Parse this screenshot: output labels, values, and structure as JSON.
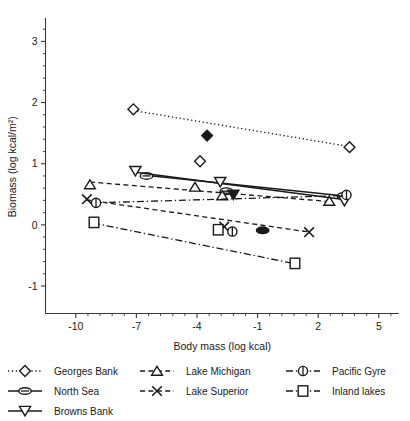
{
  "chart_data": {
    "type": "scatter",
    "title": "",
    "xlabel": "Body mass (log kcal)",
    "ylabel": "Biomass (log kcal/m²)",
    "xlim": [
      -11.5,
      6.0
    ],
    "ylim": [
      -1.45,
      3.35
    ],
    "xticks": [
      -10,
      -7,
      -4,
      -1,
      2,
      5
    ],
    "xticklabels": [
      "-10",
      "-7",
      "-4",
      "-1",
      "2",
      "5"
    ],
    "yticks": [
      -1,
      0,
      1,
      2,
      3
    ],
    "yticklabels": [
      "-1",
      "0",
      "1",
      "2",
      "3"
    ],
    "xminor_step": 0.6,
    "yminor_step": 0.2,
    "grid": false,
    "legend_position": "below-axes",
    "series": [
      {
        "name": "Georges Bank",
        "marker": "diamond",
        "linestyle": "dotted",
        "fill": "none",
        "points": [
          {
            "x": -7.15,
            "y": 1.89
          },
          {
            "x": -3.5,
            "y": 1.46,
            "fill": "solid"
          },
          {
            "x": -3.85,
            "y": 1.04
          },
          {
            "x": 3.55,
            "y": 1.27
          }
        ],
        "fit": {
          "x0": -7.15,
          "y0": 1.87,
          "x1": 3.55,
          "y1": 1.28
        }
      },
      {
        "name": "North Sea",
        "marker": "ellipse",
        "linestyle": "solid",
        "fill": "none",
        "points": [
          {
            "x": -6.5,
            "y": 0.8
          },
          {
            "x": -2.55,
            "y": 0.55
          },
          {
            "x": -0.75,
            "y": -0.09,
            "fill": "solid"
          },
          {
            "x": 3.25,
            "y": 0.47
          }
        ],
        "fit": {
          "x0": -6.55,
          "y0": 0.81,
          "x1": 3.3,
          "y1": 0.47
        }
      },
      {
        "name": "Browns Bank",
        "marker": "triangle-down",
        "linestyle": "solid",
        "fill": "none",
        "points": [
          {
            "x": -7.05,
            "y": 0.88
          },
          {
            "x": -2.85,
            "y": 0.7
          },
          {
            "x": -2.2,
            "y": 0.49,
            "fill": "solid"
          },
          {
            "x": 3.3,
            "y": 0.39
          }
        ],
        "fit": {
          "x0": -7.05,
          "y0": 0.86,
          "x1": 3.35,
          "y1": 0.41
        }
      },
      {
        "name": "Lake Michigan",
        "marker": "triangle-up",
        "linestyle": "dashed",
        "fill": "none",
        "points": [
          {
            "x": -9.3,
            "y": 0.66
          },
          {
            "x": -4.1,
            "y": 0.62
          },
          {
            "x": -2.75,
            "y": 0.48
          },
          {
            "x": 2.55,
            "y": 0.39
          }
        ],
        "fit": {
          "x0": -9.3,
          "y0": 0.7,
          "x1": 2.6,
          "y1": 0.38
        }
      },
      {
        "name": "Lake Superior",
        "marker": "x",
        "linestyle": "dashed",
        "fill": "none",
        "points": [
          {
            "x": -9.45,
            "y": 0.42
          },
          {
            "x": -2.65,
            "y": -0.03
          },
          {
            "x": 1.55,
            "y": -0.12
          }
        ],
        "fit": {
          "x0": -9.5,
          "y0": 0.41,
          "x1": 1.6,
          "y1": -0.12
        }
      },
      {
        "name": "Pacific Gyre",
        "marker": "circle-bar",
        "linestyle": "dashdot",
        "fill": "none",
        "points": [
          {
            "x": -9.0,
            "y": 0.36
          },
          {
            "x": -2.25,
            "y": -0.11
          },
          {
            "x": 3.4,
            "y": 0.49
          }
        ],
        "fit": {
          "x0": -9.05,
          "y0": 0.36,
          "x1": 3.4,
          "y1": 0.48
        }
      },
      {
        "name": "Inland lakes",
        "marker": "square",
        "linestyle": "dashdot",
        "fill": "none",
        "points": [
          {
            "x": -9.1,
            "y": 0.04
          },
          {
            "x": -2.95,
            "y": -0.08
          },
          {
            "x": 0.85,
            "y": -0.63
          }
        ],
        "fit": {
          "x0": -9.15,
          "y0": 0.03,
          "x1": 0.9,
          "y1": -0.64
        }
      }
    ],
    "legend": [
      {
        "label": "Georges Bank",
        "marker": "diamond",
        "linestyle": "dotted",
        "column": 0
      },
      {
        "label": "North Sea",
        "marker": "ellipse",
        "linestyle": "solid",
        "column": 0
      },
      {
        "label": "Browns Bank",
        "marker": "triangle-down",
        "linestyle": "solid",
        "column": 0
      },
      {
        "label": "Lake Michigan",
        "marker": "triangle-up",
        "linestyle": "dashed",
        "column": 1
      },
      {
        "label": "Lake Superior",
        "marker": "x",
        "linestyle": "dashed",
        "column": 1
      },
      {
        "label": "Pacific Gyre",
        "marker": "circle-bar",
        "linestyle": "dashdot",
        "column": 2
      },
      {
        "label": "Inland lakes",
        "marker": "square",
        "linestyle": "dashdot",
        "column": 2
      }
    ],
    "colors": {
      "ink": "#1a1a1a",
      "axis": "#3a3a3a",
      "background": "#ffffff"
    }
  }
}
